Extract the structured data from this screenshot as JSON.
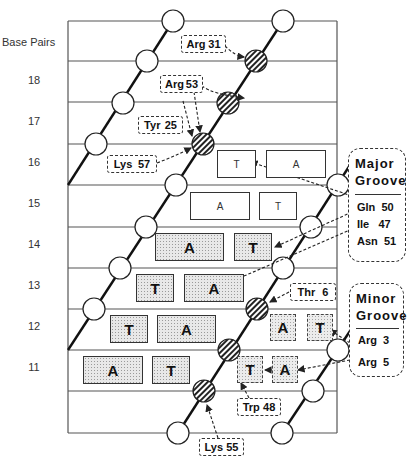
{
  "axis": {
    "label": "Base Pairs"
  },
  "rows": [
    {
      "label": "18"
    },
    {
      "label": "17"
    },
    {
      "label": "16"
    },
    {
      "label": "15"
    },
    {
      "label": "14"
    },
    {
      "label": "13"
    },
    {
      "label": "12"
    },
    {
      "label": "11"
    }
  ],
  "bases": {
    "r16": [
      {
        "label": "T"
      },
      {
        "label": "A"
      }
    ],
    "r15": [
      {
        "label": "A"
      },
      {
        "label": "T"
      }
    ],
    "r14": [
      {
        "label": "A"
      },
      {
        "label": "T"
      }
    ],
    "r13": [
      {
        "label": "T"
      },
      {
        "label": "A"
      }
    ],
    "r12": [
      {
        "label": "T"
      },
      {
        "label": "A"
      },
      {
        "label": "A"
      },
      {
        "label": "T"
      }
    ],
    "r11": [
      {
        "label": "A"
      },
      {
        "label": "T"
      },
      {
        "label": "T"
      },
      {
        "label": "A"
      }
    ]
  },
  "residues": {
    "arg31": {
      "name": "Arg",
      "num": "31"
    },
    "arg53": {
      "name": "Arg",
      "num": "53"
    },
    "tyr25": {
      "name": "Tyr",
      "num": "25"
    },
    "lys57": {
      "name": "Lys",
      "num": "57"
    },
    "thr6": {
      "name": "Thr",
      "num": "6"
    },
    "trp48": {
      "name": "Trp",
      "num": "48"
    },
    "lys55": {
      "name": "Lys",
      "num": "55"
    }
  },
  "major_groove": {
    "title_1": "Major",
    "title_2": "Groove",
    "items": [
      "Gln  50",
      "Ile   47",
      "Asn  51"
    ]
  },
  "minor_groove": {
    "title_1": "Minor",
    "title_2": "Groove",
    "items": [
      "Arg  3",
      "Arg  5"
    ]
  }
}
